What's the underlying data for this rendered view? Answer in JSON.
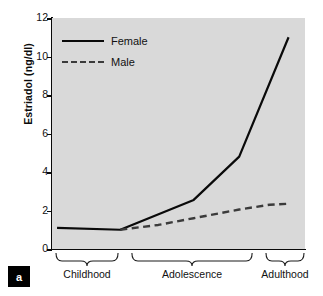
{
  "panel": {
    "label": "a"
  },
  "axes": {
    "ylabel": "Estriadol (ng/dl)",
    "yticks": [
      "12",
      "10",
      "8",
      "6",
      "4",
      "2",
      "0"
    ],
    "xcategories": [
      "Childhood",
      "Adolescence",
      "Adulthood"
    ]
  },
  "legend": {
    "items": [
      {
        "label": "Female",
        "style": "solid"
      },
      {
        "label": "Male",
        "style": "dashed"
      }
    ]
  },
  "colors": {
    "plot_background": "#d9d9d9",
    "page_background": "#ffffff",
    "axis": "#0a0a0a",
    "female_line": "#0a0a0a",
    "male_line": "#3b3b3b",
    "panel_tag_background": "#000000",
    "panel_tag_text": "#ffffff"
  },
  "chart_data": {
    "type": "line",
    "title": "",
    "xlabel": "",
    "ylabel": "Estriadol (ng/dl)",
    "ylim": [
      0,
      12
    ],
    "yticks": [
      0,
      2,
      4,
      6,
      8,
      10,
      12
    ],
    "grid": false,
    "legend_position": "upper-left",
    "x_stage_labels": [
      "Childhood",
      "Adolescence",
      "Adulthood"
    ],
    "x_stage_ranges": [
      [
        0,
        0.265
      ],
      [
        0.3,
        0.795
      ],
      [
        0.83,
        1.0
      ]
    ],
    "xlim": [
      0,
      1
    ],
    "annotations": [
      "a"
    ],
    "series": [
      {
        "name": "Female",
        "style": "solid",
        "color": "#0a0a0a",
        "x": [
          0.02,
          0.27,
          0.56,
          0.74,
          0.935
        ],
        "values": [
          1.1,
          1.0,
          2.55,
          4.8,
          11.0
        ]
      },
      {
        "name": "Male",
        "style": "dashed",
        "color": "#3b3b3b",
        "x": [
          0.27,
          0.42,
          0.56,
          0.74,
          0.86,
          0.935
        ],
        "values": [
          1.0,
          1.25,
          1.6,
          2.05,
          2.3,
          2.35
        ]
      }
    ]
  }
}
